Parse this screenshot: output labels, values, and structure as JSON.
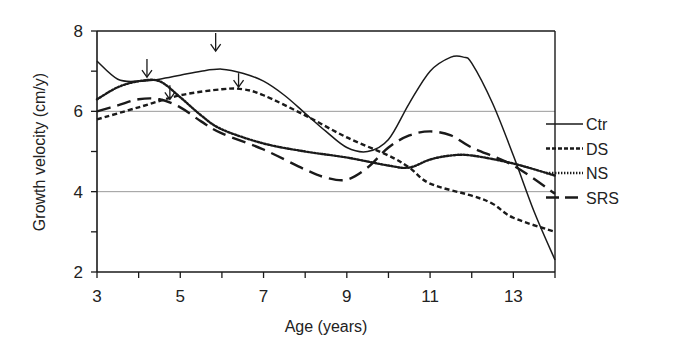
{
  "chart_data": {
    "type": "line",
    "title": "",
    "xlabel": "Age (years)",
    "ylabel": "Growth velocity (cm/y)",
    "xlim": [
      3,
      14
    ],
    "ylim": [
      2,
      8
    ],
    "x_ticks": [
      3,
      5,
      7,
      9,
      11,
      13
    ],
    "x_minor_ticks": [
      4,
      6,
      8,
      10,
      12,
      14
    ],
    "y_ticks": [
      2,
      4,
      6,
      8
    ],
    "y_minor_ticks": [
      3,
      5,
      7
    ],
    "gridlines_y": [
      4,
      6
    ],
    "legend_position": "right",
    "series": [
      {
        "name": "Ctr",
        "style": "solid",
        "points": [
          [
            3,
            7.25
          ],
          [
            3.5,
            6.8
          ],
          [
            4,
            6.75
          ],
          [
            4.5,
            6.8
          ],
          [
            5,
            6.9
          ],
          [
            5.5,
            7.0
          ],
          [
            6,
            7.05
          ],
          [
            6.5,
            6.95
          ],
          [
            7,
            6.75
          ],
          [
            7.5,
            6.4
          ],
          [
            8,
            5.95
          ],
          [
            8.5,
            5.5
          ],
          [
            9,
            5.1
          ],
          [
            9.5,
            5.0
          ],
          [
            10,
            5.3
          ],
          [
            10.5,
            6.2
          ],
          [
            11,
            7.0
          ],
          [
            11.5,
            7.35
          ],
          [
            11.8,
            7.35
          ],
          [
            12,
            7.2
          ],
          [
            12.5,
            6.2
          ],
          [
            13,
            4.9
          ],
          [
            13.5,
            3.5
          ],
          [
            14,
            2.3
          ]
        ]
      },
      {
        "name": "DS",
        "style": "short-dash",
        "points": [
          [
            3,
            5.8
          ],
          [
            4,
            6.1
          ],
          [
            5,
            6.4
          ],
          [
            6,
            6.55
          ],
          [
            6.5,
            6.55
          ],
          [
            7,
            6.4
          ],
          [
            8,
            5.9
          ],
          [
            9,
            5.35
          ],
          [
            10,
            4.9
          ],
          [
            10.5,
            4.6
          ],
          [
            11,
            4.2
          ],
          [
            12,
            3.9
          ],
          [
            12.5,
            3.7
          ],
          [
            13,
            3.35
          ],
          [
            14,
            3.0
          ]
        ]
      },
      {
        "name": "NS",
        "style": "dotted",
        "points": [
          [
            3,
            6.3
          ],
          [
            3.5,
            6.6
          ],
          [
            4,
            6.75
          ],
          [
            4.5,
            6.75
          ],
          [
            5,
            6.35
          ],
          [
            5.5,
            5.9
          ],
          [
            6,
            5.55
          ],
          [
            7,
            5.2
          ],
          [
            8,
            5.0
          ],
          [
            9,
            4.85
          ],
          [
            10,
            4.65
          ],
          [
            10.5,
            4.6
          ],
          [
            11,
            4.8
          ],
          [
            11.5,
            4.9
          ],
          [
            12,
            4.9
          ],
          [
            13,
            4.7
          ],
          [
            14,
            4.4
          ]
        ]
      },
      {
        "name": "SRS",
        "style": "long-dash",
        "points": [
          [
            3,
            6.0
          ],
          [
            3.5,
            6.15
          ],
          [
            4,
            6.3
          ],
          [
            4.5,
            6.3
          ],
          [
            5,
            6.1
          ],
          [
            5.5,
            5.75
          ],
          [
            6,
            5.45
          ],
          [
            7,
            5.05
          ],
          [
            8,
            4.55
          ],
          [
            8.5,
            4.35
          ],
          [
            9,
            4.3
          ],
          [
            9.5,
            4.6
          ],
          [
            10,
            5.1
          ],
          [
            10.5,
            5.4
          ],
          [
            11,
            5.5
          ],
          [
            11.5,
            5.4
          ],
          [
            12,
            5.1
          ],
          [
            13,
            4.65
          ],
          [
            14,
            3.95
          ]
        ]
      }
    ],
    "annotations": [
      {
        "type": "arrow-down",
        "x": 4.2,
        "y_from": 7.3,
        "y_to": 6.85,
        "note": "peak marker"
      },
      {
        "type": "arrow-down",
        "x": 5.85,
        "y_from": 7.95,
        "y_to": 7.5,
        "note": "peak marker"
      },
      {
        "type": "arrow-down",
        "x": 4.75,
        "y_from": 6.65,
        "y_to": 6.3,
        "note": "peak marker"
      },
      {
        "type": "arrow-down",
        "x": 6.4,
        "y_from": 6.95,
        "y_to": 6.6,
        "note": "peak marker"
      }
    ]
  },
  "axes": {
    "x_title": "Age (years)",
    "y_title": "Growth velocity (cm/y)",
    "x_tick_labels": [
      "3",
      "5",
      "7",
      "9",
      "11",
      "13"
    ],
    "y_tick_labels": [
      "2",
      "4",
      "6",
      "8"
    ]
  },
  "legend": {
    "items": [
      {
        "label": "Ctr",
        "style": "solid"
      },
      {
        "label": "DS",
        "style": "short-dash"
      },
      {
        "label": "NS",
        "style": "dotted"
      },
      {
        "label": "SRS",
        "style": "long-dash"
      }
    ]
  },
  "colors": {
    "line": "#1a1a1a",
    "grid": "#9a9a9a",
    "axis": "#1a1a1a"
  }
}
